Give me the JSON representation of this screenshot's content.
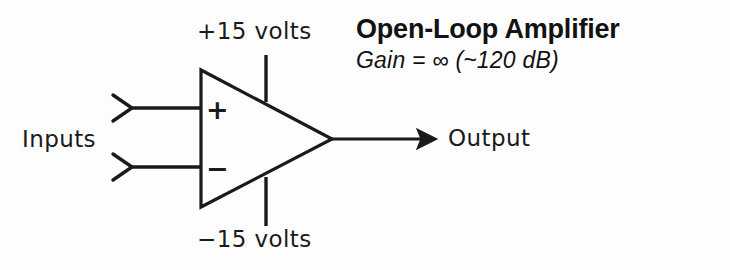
{
  "diagram": {
    "kind": "op-amp-schematic",
    "background_color": "#fdfdfd",
    "ink_color": "#1a1a1a",
    "title": "Open-Loop Amplifier",
    "gain_note": "Gain = ∞ (~120 dB)",
    "labels": {
      "supply_positive": "+15 volts",
      "supply_negative": "−15 volts",
      "inputs": "Inputs",
      "output": "Output",
      "noninverting_sign": "+",
      "inverting_sign": "−"
    },
    "geometry": {
      "triangle": {
        "left_x": 201,
        "apex_x": 332,
        "top_y": 70,
        "bottom_y": 207,
        "apex_y": 139
      },
      "input_wire_y_top": 108,
      "input_wire_y_bottom": 167,
      "input_wire_start_x": 130,
      "input_chevron_tip_x": 113,
      "output_wire_end_x": 437,
      "supply_rail_x": 266,
      "supply_rail_top_y": 55,
      "supply_rail_bottom_y": 226,
      "stroke_width": 3
    }
  }
}
